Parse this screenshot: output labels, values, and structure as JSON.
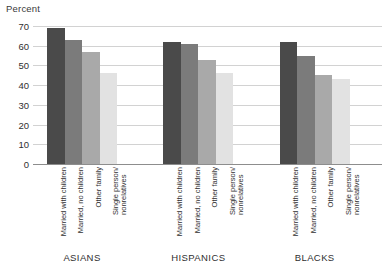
{
  "chart_data": {
    "type": "bar",
    "title": "",
    "subtitle": "",
    "xlabel": "",
    "ylabel": "Percent",
    "ylim": [
      0,
      70
    ],
    "yticks": [
      0,
      10,
      20,
      30,
      40,
      50,
      60,
      70
    ],
    "ytick_labels": [
      "0",
      "10",
      "20",
      "30",
      "40",
      "50",
      "60",
      "70"
    ],
    "grid": true,
    "legend": "none",
    "categories": [
      "Married with children",
      "Married, no children",
      "Other family",
      "Single person/ nonrelatives"
    ],
    "category_lines": [
      [
        "Married with children"
      ],
      [
        "Married, no children"
      ],
      [
        "Other family"
      ],
      [
        "Single person/",
        "nonrelatives"
      ]
    ],
    "groups": [
      "ASIANS",
      "HISPANICS",
      "BLACKS"
    ],
    "series": [
      {
        "name": "ASIANS",
        "values": [
          69,
          63,
          57,
          46
        ]
      },
      {
        "name": "HISPANICS",
        "values": [
          62,
          61,
          53,
          46
        ]
      },
      {
        "name": "BLACKS",
        "values": [
          62,
          55,
          45,
          43
        ]
      }
    ],
    "bar_colors": [
      "#4a4a4a",
      "#7b7b7b",
      "#a9a9a9",
      "#e2e2e2"
    ],
    "gridline_color": "#d2d2d2",
    "axis_color": "#8d8d8d",
    "text_color": "#2f2f2f"
  }
}
